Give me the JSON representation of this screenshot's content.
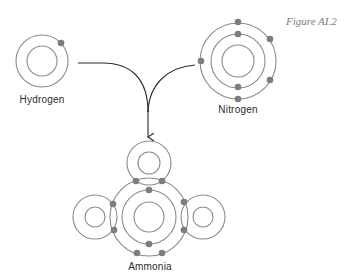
{
  "figure": {
    "caption": "Figure AI.2",
    "colors": {
      "shell": "#8a8a8a",
      "electron": "#7d7d7d",
      "connector": "#2a2a2a",
      "label": "#2b2b2b",
      "caption": "#7a7a7a"
    }
  },
  "atoms": {
    "hydrogen": {
      "label": "Hydrogen",
      "shells": 1,
      "electrons": 1
    },
    "nitrogen": {
      "label": "Nitrogen",
      "shells": 2,
      "electrons": 7,
      "outer_shell_electrons": 5
    }
  },
  "product": {
    "label": "Ammonia",
    "formula_parts": [
      "N",
      "H",
      "H",
      "H"
    ],
    "shared_electron_pairs": 3,
    "lone_pair": 1
  },
  "connector": {
    "description": "curved arrows merging into a downward arrow",
    "arrow_direction": "down"
  }
}
